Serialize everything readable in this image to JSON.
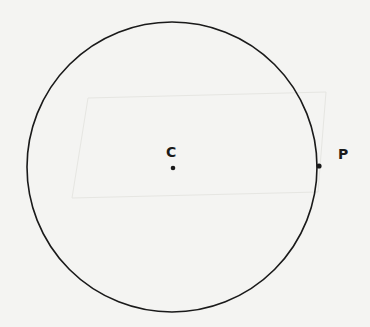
{
  "diagram": {
    "type": "circle-with-points",
    "circle": {
      "cx": 172,
      "cy": 167,
      "r": 145,
      "stroke": "#1a1a1a"
    },
    "points": [
      {
        "id": "center",
        "label": "C",
        "x": 173,
        "y": 168,
        "label_x": 166,
        "label_y": 145
      },
      {
        "id": "on-circle",
        "label": "P",
        "x": 319,
        "y": 166,
        "label_x": 338,
        "label_y": 147
      }
    ],
    "background": "#f4f4f2"
  }
}
